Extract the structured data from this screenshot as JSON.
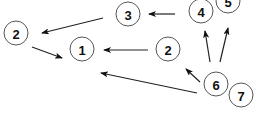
{
  "diagram": {
    "type": "directed-graph",
    "colors": {
      "node_stroke": "#555555",
      "node_fill": "#ffffff",
      "edge": "#222222",
      "label": "#111111"
    },
    "nodes": [
      {
        "id": "n3",
        "label": "3",
        "cx": 128,
        "cy": 14,
        "r": 12
      },
      {
        "id": "n2a",
        "label": "2",
        "cx": 16,
        "cy": 33,
        "r": 12
      },
      {
        "id": "n1",
        "label": "1",
        "cx": 82,
        "cy": 49,
        "r": 12
      },
      {
        "id": "n4",
        "label": "4",
        "cx": 201,
        "cy": 11,
        "r": 12
      },
      {
        "id": "n5",
        "label": "5",
        "cx": 228,
        "cy": 1,
        "r": 12
      },
      {
        "id": "n2b",
        "label": "2",
        "cx": 168,
        "cy": 49,
        "r": 12
      },
      {
        "id": "n6",
        "label": "6",
        "cx": 216,
        "cy": 84,
        "r": 12
      },
      {
        "id": "n7",
        "label": "7",
        "cx": 241,
        "cy": 95,
        "r": 12
      }
    ],
    "edges": [
      {
        "from": "n3",
        "to": "n2a",
        "x1": 103,
        "y1": 18,
        "x2": 42,
        "y2": 33
      },
      {
        "from": "n2a",
        "to": "n1",
        "x1": 32,
        "y1": 47,
        "x2": 62,
        "y2": 58
      },
      {
        "from": "n4",
        "to": "n3",
        "x1": 175,
        "y1": 14,
        "x2": 149,
        "y2": 14
      },
      {
        "from": "n2b",
        "to": "n1",
        "x1": 148,
        "y1": 50,
        "x2": 104,
        "y2": 50
      },
      {
        "from": "n6",
        "to": "n1",
        "x1": 197,
        "y1": 93,
        "x2": 101,
        "y2": 73
      },
      {
        "from": "n6",
        "to": "n2b",
        "x1": 200,
        "y1": 82,
        "x2": 186,
        "y2": 69
      },
      {
        "from": "n6",
        "to": "n4",
        "x1": 210,
        "y1": 62,
        "x2": 205,
        "y2": 31
      },
      {
        "from": "n6",
        "to": "n5",
        "x1": 220,
        "y1": 62,
        "x2": 228,
        "y2": 28
      }
    ]
  }
}
